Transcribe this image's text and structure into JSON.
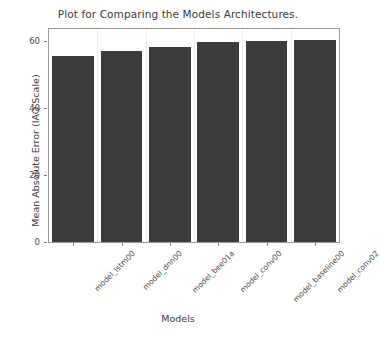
{
  "chart_data": {
    "type": "bar",
    "title": "Plot for Comparing the Models Architectures.",
    "xlabel": "Models",
    "ylabel": "Mean Absolute Error (IAQ Scale)",
    "categories": [
      "model_lstm00",
      "model_dnn00",
      "model_bee01a",
      "model_conv00",
      "model_baseline00",
      "model_conv02"
    ],
    "values": [
      55.4,
      57.0,
      58.2,
      59.7,
      60.0,
      60.3
    ],
    "ylim": [
      0,
      63.5
    ],
    "yticks": [
      0,
      20,
      40,
      60
    ],
    "ytick_labels": [
      "0",
      "20",
      "40",
      "60"
    ],
    "grid": false,
    "legend": null,
    "bar_color": "#3c3c3c",
    "axes_color": "#9a9a9a"
  }
}
